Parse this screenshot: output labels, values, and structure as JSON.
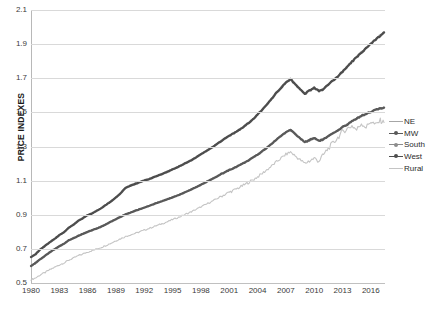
{
  "chart_data": {
    "type": "line",
    "title": "",
    "xlabel": "",
    "ylabel": "PRICE INDEXES",
    "ylim": [
      0.5,
      2.1
    ],
    "xlim": [
      1980,
      2017.5
    ],
    "ytick_labels": [
      "0.5",
      "0.7",
      "0.9",
      "1.1",
      "1.3",
      "1.5",
      "1.7",
      "1.9",
      "2.1"
    ],
    "ytick_values": [
      0.5,
      0.7,
      0.9,
      1.1,
      1.3,
      1.5,
      1.7,
      1.9,
      2.1
    ],
    "xtick_labels": [
      "1980",
      "1983",
      "1986",
      "1989",
      "1992",
      "1995",
      "1998",
      "2001",
      "2004",
      "2007",
      "2010",
      "2013",
      "2016"
    ],
    "xtick_values": [
      1980,
      1983,
      1986,
      1989,
      1992,
      1995,
      1998,
      2001,
      2004,
      2007,
      2010,
      2013,
      2016
    ],
    "grid": "horizontal",
    "legend_position": "right",
    "colors": {
      "NE": "#a6a6a6",
      "MW": "#595959",
      "South": "#8c8c8c",
      "West": "#4d4d4d",
      "Rural": "#c4c4c4"
    },
    "x": [
      1980,
      1980.5,
      1981,
      1981.5,
      1982,
      1982.5,
      1983,
      1983.5,
      1984,
      1984.5,
      1985,
      1985.5,
      1986,
      1986.5,
      1987,
      1987.5,
      1988,
      1988.5,
      1989,
      1989.5,
      1990,
      1990.5,
      1991,
      1991.5,
      1992,
      1992.5,
      1993,
      1993.5,
      1994,
      1994.5,
      1995,
      1995.5,
      1996,
      1996.5,
      1997,
      1997.5,
      1998,
      1998.5,
      1999,
      1999.5,
      2000,
      2000.5,
      2001,
      2001.5,
      2002,
      2002.5,
      2003,
      2003.5,
      2004,
      2004.5,
      2005,
      2005.5,
      2006,
      2006.5,
      2007,
      2007.5,
      2008,
      2008.5,
      2009,
      2009.5,
      2010,
      2010.5,
      2011,
      2011.5,
      2012,
      2012.5,
      2013,
      2013.5,
      2014,
      2014.5,
      2015,
      2015.5,
      2016,
      2016.5,
      2017,
      2017.4
    ],
    "series": [
      {
        "name": "NE",
        "values": [
          0.655,
          0.672,
          0.7,
          0.72,
          0.742,
          0.76,
          0.783,
          0.8,
          0.826,
          0.845,
          0.868,
          0.882,
          0.9,
          0.91,
          0.926,
          0.942,
          0.962,
          0.982,
          1.005,
          1.03,
          1.06,
          1.075,
          1.085,
          1.095,
          1.105,
          1.112,
          1.124,
          1.134,
          1.146,
          1.157,
          1.17,
          1.182,
          1.196,
          1.21,
          1.224,
          1.24,
          1.258,
          1.275,
          1.292,
          1.31,
          1.33,
          1.348,
          1.366,
          1.382,
          1.4,
          1.418,
          1.44,
          1.462,
          1.49,
          1.52,
          1.552,
          1.585,
          1.62,
          1.65,
          1.68,
          1.7,
          1.668,
          1.64,
          1.612,
          1.63,
          1.648,
          1.628,
          1.64,
          1.668,
          1.69,
          1.712,
          1.742,
          1.77,
          1.8,
          1.828,
          1.855,
          1.878,
          1.905,
          1.93,
          1.955,
          1.972
        ]
      },
      {
        "name": "MW",
        "values": [
          0.6,
          0.618,
          0.64,
          0.66,
          0.68,
          0.698,
          0.716,
          0.73,
          0.75,
          0.762,
          0.776,
          0.788,
          0.8,
          0.81,
          0.82,
          0.832,
          0.846,
          0.86,
          0.874,
          0.888,
          0.902,
          0.912,
          0.922,
          0.932,
          0.942,
          0.952,
          0.962,
          0.972,
          0.982,
          0.992,
          1.002,
          1.012,
          1.024,
          1.036,
          1.048,
          1.062,
          1.076,
          1.09,
          1.104,
          1.118,
          1.134,
          1.148,
          1.162,
          1.174,
          1.188,
          1.202,
          1.218,
          1.234,
          1.252,
          1.272,
          1.294,
          1.316,
          1.34,
          1.362,
          1.384,
          1.398,
          1.372,
          1.348,
          1.326,
          1.338,
          1.35,
          1.334,
          1.342,
          1.36,
          1.376,
          1.392,
          1.412,
          1.43,
          1.448,
          1.464,
          1.48,
          1.492,
          1.504,
          1.514,
          1.522,
          1.528
        ]
      },
      {
        "name": "South",
        "values": [
          0.602,
          0.62,
          0.642,
          0.662,
          0.682,
          0.7,
          0.718,
          0.732,
          0.752,
          0.764,
          0.778,
          0.79,
          0.802,
          0.812,
          0.822,
          0.834,
          0.848,
          0.862,
          0.876,
          0.89,
          0.904,
          0.914,
          0.924,
          0.934,
          0.944,
          0.954,
          0.964,
          0.974,
          0.984,
          0.994,
          1.004,
          1.014,
          1.026,
          1.038,
          1.05,
          1.064,
          1.078,
          1.092,
          1.106,
          1.12,
          1.136,
          1.15,
          1.164,
          1.176,
          1.19,
          1.204,
          1.22,
          1.236,
          1.254,
          1.274,
          1.296,
          1.318,
          1.342,
          1.364,
          1.386,
          1.4,
          1.374,
          1.35,
          1.328,
          1.34,
          1.352,
          1.336,
          1.344,
          1.362,
          1.378,
          1.394,
          1.414,
          1.432,
          1.45,
          1.466,
          1.482,
          1.494,
          1.506,
          1.516,
          1.524,
          1.53
        ]
      },
      {
        "name": "West",
        "values": [
          0.652,
          0.67,
          0.698,
          0.718,
          0.74,
          0.758,
          0.78,
          0.798,
          0.824,
          0.842,
          0.865,
          0.88,
          0.898,
          0.908,
          0.924,
          0.94,
          0.96,
          0.98,
          1.002,
          1.026,
          1.056,
          1.07,
          1.08,
          1.09,
          1.1,
          1.108,
          1.12,
          1.13,
          1.142,
          1.153,
          1.166,
          1.178,
          1.192,
          1.206,
          1.22,
          1.236,
          1.254,
          1.271,
          1.288,
          1.306,
          1.326,
          1.344,
          1.362,
          1.378,
          1.396,
          1.414,
          1.436,
          1.458,
          1.486,
          1.516,
          1.548,
          1.58,
          1.615,
          1.645,
          1.675,
          1.695,
          1.663,
          1.635,
          1.608,
          1.626,
          1.644,
          1.624,
          1.636,
          1.664,
          1.686,
          1.708,
          1.738,
          1.766,
          1.796,
          1.824,
          1.851,
          1.874,
          1.901,
          1.926,
          1.951,
          1.968
        ]
      },
      {
        "name": "Rural",
        "values": [
          0.52,
          0.53,
          0.548,
          0.562,
          0.578,
          0.592,
          0.606,
          0.618,
          0.634,
          0.646,
          0.66,
          0.67,
          0.682,
          0.69,
          0.7,
          0.71,
          0.722,
          0.734,
          0.748,
          0.76,
          0.772,
          0.782,
          0.79,
          0.8,
          0.81,
          0.82,
          0.83,
          0.84,
          0.85,
          0.86,
          0.872,
          0.882,
          0.894,
          0.906,
          0.918,
          0.932,
          0.946,
          0.96,
          0.974,
          0.988,
          1.004,
          1.018,
          1.032,
          1.044,
          1.058,
          1.072,
          1.088,
          1.104,
          1.122,
          1.142,
          1.164,
          1.186,
          1.21,
          1.232,
          1.254,
          1.268,
          1.244,
          1.222,
          1.202,
          1.216,
          1.23,
          1.216,
          1.252,
          1.29,
          1.32,
          1.352,
          1.386,
          1.404,
          1.422,
          1.398,
          1.436,
          1.412,
          1.448,
          1.426,
          1.452,
          1.44
        ]
      }
    ]
  },
  "legend": {
    "items": [
      {
        "label": "NE",
        "marker": false
      },
      {
        "label": "MW",
        "marker": true
      },
      {
        "label": "South",
        "marker": true
      },
      {
        "label": "West",
        "marker": true
      },
      {
        "label": "Rural",
        "marker": false
      }
    ]
  }
}
